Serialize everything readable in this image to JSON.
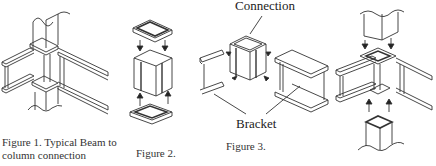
{
  "figures": [
    {
      "id": "fig1",
      "caption_line1": "Figure 1. Typical Beam to",
      "caption_line2": "column connection"
    },
    {
      "id": "fig2",
      "caption": "Figure 2."
    },
    {
      "id": "fig3",
      "caption": "Figure 3.",
      "labels": {
        "top": "Connection",
        "bottom": "Bracket"
      }
    },
    {
      "id": "fig4",
      "caption": ""
    }
  ],
  "colors": {
    "line": "#333333",
    "background": "#ffffff"
  }
}
